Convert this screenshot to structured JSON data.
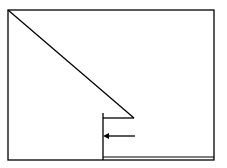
{
  "diagram": {
    "stroke_color": "#000000",
    "background_color": "#ffffff",
    "frame": {
      "x1": 8,
      "y1": 10,
      "x2": 214,
      "y2": 160
    },
    "diagonal": {
      "x1": 8,
      "y1": 10,
      "x2": 134,
      "y2": 118
    },
    "ledge": {
      "x1": 103,
      "y1": 118,
      "x2": 134,
      "y2": 118
    },
    "vertical": {
      "x1": 103,
      "y1": 113,
      "x2": 103,
      "y2": 160
    },
    "arrow": {
      "x1": 135,
      "y1": 136,
      "x2": 103,
      "y2": 136,
      "direction": "left"
    },
    "floor_line": {
      "x1": 103,
      "y1": 157,
      "x2": 214,
      "y2": 157
    }
  }
}
